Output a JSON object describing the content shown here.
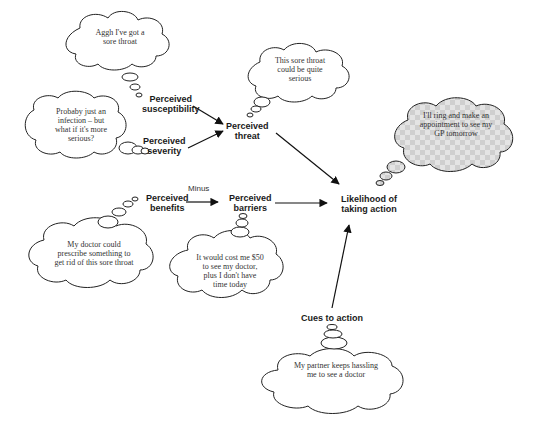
{
  "diagram": {
    "type": "health-belief-model",
    "nodes": {
      "susceptibility": "Perceived susceptibility",
      "susceptibility_l1": "Perceived",
      "susceptibility_l2": "susceptibility",
      "severity_l1": "Perceived",
      "severity_l2": "severity",
      "threat_l1": "Perceived",
      "threat_l2": "threat",
      "benefits_l1": "Perceived",
      "benefits_l2": "benefits",
      "barriers_l1": "Perceived",
      "barriers_l2": "barriers",
      "action_l1": "Likelihood of",
      "action_l2": "taking action",
      "cues": "Cues to action"
    },
    "edge_labels": {
      "benefits_to_barriers": "Minus"
    },
    "thoughts": {
      "susceptibility": [
        "Aggh I've got a",
        "sore throat"
      ],
      "severity": [
        "Probaby just an",
        "infection – but",
        "what if it's more",
        "serious?"
      ],
      "threat": [
        "This sore throat",
        "could be quite",
        "serious"
      ],
      "action": [
        "I'll ring and make an",
        "appointment to see my",
        "GP tomorrow"
      ],
      "benefits": [
        "My doctor could",
        "prescribe something to",
        "get rid of this sore throat"
      ],
      "barriers": [
        "It would cost me $50",
        "to see my doctor,",
        "plus I don't have",
        "time today"
      ],
      "cues": [
        "My partner keeps hassling",
        "me to see a doctor"
      ]
    },
    "edges": [
      {
        "from": "Perceived susceptibility",
        "to": "Perceived threat"
      },
      {
        "from": "Perceived severity",
        "to": "Perceived threat"
      },
      {
        "from": "Perceived threat",
        "to": "Likelihood of taking action"
      },
      {
        "from": "Perceived benefits",
        "to": "Perceived barriers",
        "label": "Minus"
      },
      {
        "from": "Perceived barriers",
        "to": "Likelihood of taking action"
      },
      {
        "from": "Cues to action",
        "to": "Likelihood of taking action"
      }
    ],
    "colors": {
      "stroke": "#1a1a1a",
      "highlight_cloud_fill": "#d8d8d8",
      "cloud_fill": "#ffffff"
    }
  }
}
